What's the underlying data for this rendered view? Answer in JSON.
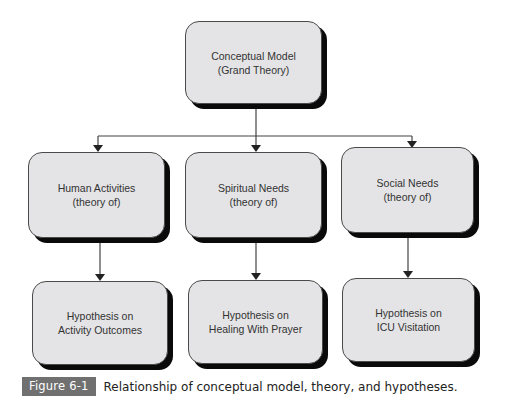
{
  "diagram": {
    "type": "hierarchy",
    "root": {
      "line1": "Conceptual Model",
      "line2": "(Grand Theory)"
    },
    "theories": [
      {
        "line1": "Human Activities",
        "line2": "(theory of)"
      },
      {
        "line1": "Spiritual Needs",
        "line2": "(theory of)"
      },
      {
        "line1": "Social Needs",
        "line2": "(theory of)"
      }
    ],
    "hypotheses": [
      {
        "line1": "Hypothesis on",
        "line2": "Activity Outcomes"
      },
      {
        "line1": "Hypothesis on",
        "line2": "Healing With Prayer"
      },
      {
        "line1": "Hypothesis on",
        "line2": "ICU Visitation"
      }
    ],
    "edges": [
      [
        "Conceptual Model",
        "Human Activities"
      ],
      [
        "Conceptual Model",
        "Spiritual Needs"
      ],
      [
        "Conceptual Model",
        "Social Needs"
      ],
      [
        "Human Activities",
        "Hypothesis on Activity Outcomes"
      ],
      [
        "Spiritual Needs",
        "Hypothesis on Healing With Prayer"
      ],
      [
        "Social Needs",
        "Hypothesis on ICU Visitation"
      ]
    ],
    "colors": {
      "box_fill": "#e4e4e6",
      "box_shadow": "#0a0a0a",
      "line": "#444444",
      "label_bg": "#707070"
    }
  },
  "caption": {
    "label": "Figure 6-1",
    "text": "Relationship of conceptual model, theory, and hypotheses."
  }
}
